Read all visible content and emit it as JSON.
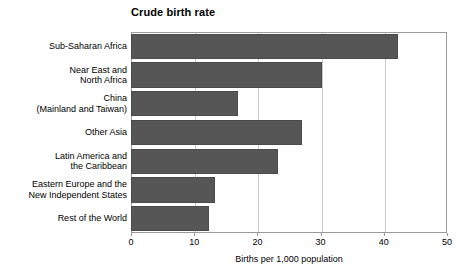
{
  "chart_data": {
    "type": "bar",
    "orientation": "horizontal",
    "title": "Crude birth rate",
    "xlabel": "Births per 1,000 population",
    "ylabel": "",
    "xlim": [
      0,
      50
    ],
    "xticks": [
      0,
      10,
      20,
      30,
      40,
      50
    ],
    "xtick_labels": [
      "0",
      "10",
      "20",
      "30",
      "40",
      "50"
    ],
    "grid": true,
    "grid_axis": "x",
    "legend": false,
    "categories": [
      "Sub-Saharan Africa",
      "Near East and\nNorth Africa",
      "China\n(Mainland and Taiwan)",
      "Other Asia",
      "Latin America and\nthe Caribbean",
      "Eastern Europe and the\nNew Independent States",
      "Rest of the World"
    ],
    "values": [
      42.2,
      30.2,
      16.9,
      27.0,
      23.3,
      13.3,
      12.4
    ],
    "bar_color": "#565656",
    "bar_edge_color": "#4a4a4a",
    "plot_border_color": "#9a9a9a",
    "grid_color": "#c9c9c9",
    "background_color": "#ffffff"
  }
}
